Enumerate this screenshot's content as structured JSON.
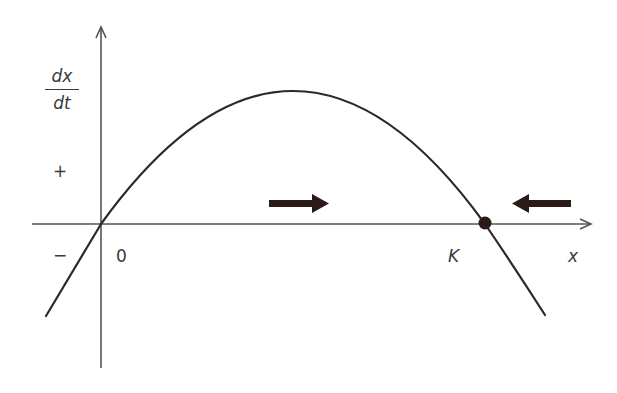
{
  "diagram": {
    "title": "",
    "y_axis_label": {
      "numerator": "dx",
      "denominator": "dt"
    },
    "x_axis_label": "x",
    "sign_labels": {
      "positive": "+",
      "negative": "−"
    },
    "tick_labels": {
      "origin": "0",
      "carrying_capacity": "K"
    },
    "curve": "dx/dt = r x (1 − x/K) (inverted parabola)",
    "equilibria": [
      {
        "label": "0",
        "type": "unstable",
        "marker": "none"
      },
      {
        "label": "K",
        "type": "stable",
        "marker": "filled-dot"
      }
    ],
    "flow_arrows": [
      {
        "direction": "right",
        "region": "0 < x < K"
      },
      {
        "direction": "left",
        "region": "x > K"
      }
    ],
    "colors": {
      "axis": "#555555",
      "curve": "#2a2a2a",
      "arrow": "#2b1a17",
      "dot": "#2b1a17",
      "text": "#3a3a3a",
      "background": "#ffffff"
    }
  }
}
